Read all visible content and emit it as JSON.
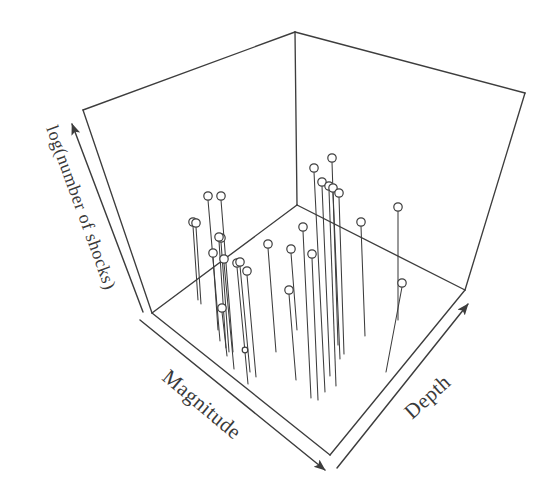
{
  "figure": {
    "title": "",
    "background_color": "#ffffff",
    "ink_color": "#3d3d3d",
    "width": 552,
    "height": 493
  },
  "axes": {
    "x": {
      "name": "magnitude-axis",
      "label": "Magnitude",
      "arrow_direction": "down-right",
      "label_rotation_deg": 40
    },
    "y": {
      "name": "depth-axis",
      "label": "Depth",
      "arrow_direction": "up-right",
      "label_rotation_deg": 40
    },
    "z": {
      "name": "log-shocks-axis",
      "label": "log(number of shocks)",
      "arrow_direction": "up-left",
      "label_rotation_deg": 72
    }
  },
  "chart_data": {
    "type": "scatter",
    "subtype": "3d-stem",
    "title": "",
    "xlabel": "Magnitude",
    "ylabel": "Depth",
    "zlabel": "log(number of shocks)",
    "grid": false,
    "legend": "none",
    "axis_ticks": "none",
    "marker": "open-circle",
    "stem_to_floor": true,
    "n_points": 27,
    "note": "Axes are unlabelled arrows; values are read as normalized positions in the projected 3D box.",
    "points": [
      {
        "id": 1,
        "head": [
          208,
          196
        ],
        "foot": [
          220,
          341
        ]
      },
      {
        "id": 2,
        "head": [
          221,
          196
        ],
        "foot": [
          233,
          352
        ]
      },
      {
        "id": 3,
        "head": [
          193,
          222
        ],
        "foot": [
          198,
          300
        ]
      },
      {
        "id": 4,
        "head": [
          221,
          238
        ],
        "foot": [
          229,
          352
        ]
      },
      {
        "id": 5,
        "head": [
          213,
          253
        ],
        "foot": [
          218,
          330
        ]
      },
      {
        "id": 6,
        "head": [
          224,
          259
        ],
        "foot": [
          234,
          369
        ]
      },
      {
        "id": 7,
        "head": [
          237,
          263
        ],
        "foot": [
          248,
          384
        ]
      },
      {
        "id": 8,
        "head": [
          247,
          271
        ],
        "foot": [
          256,
          377
        ]
      },
      {
        "id": 9,
        "head": [
          222,
          308
        ],
        "foot": [
          227,
          356
        ]
      },
      {
        "id": 10,
        "head": [
          245,
          350
        ],
        "foot": [
          245,
          352
        ]
      },
      {
        "id": 11,
        "head": [
          268,
          244
        ],
        "foot": [
          276,
          352
        ]
      },
      {
        "id": 12,
        "head": [
          291,
          249
        ],
        "foot": [
          297,
          330
        ]
      },
      {
        "id": 13,
        "head": [
          289,
          290
        ],
        "foot": [
          296,
          380
        ]
      },
      {
        "id": 14,
        "head": [
          312,
          254
        ],
        "foot": [
          318,
          400
        ]
      },
      {
        "id": 15,
        "head": [
          303,
          227
        ],
        "foot": [
          311,
          398
        ]
      },
      {
        "id": 16,
        "head": [
          314,
          168
        ],
        "foot": [
          325,
          392
        ]
      },
      {
        "id": 17,
        "head": [
          332,
          158
        ],
        "foot": [
          338,
          345
        ]
      },
      {
        "id": 18,
        "head": [
          322,
          182
        ],
        "foot": [
          330,
          376
        ]
      },
      {
        "id": 19,
        "head": [
          329,
          186
        ],
        "foot": [
          336,
          386
        ]
      },
      {
        "id": 20,
        "head": [
          333,
          188
        ],
        "foot": [
          340,
          359
        ]
      },
      {
        "id": 21,
        "head": [
          361,
          222
        ],
        "foot": [
          365,
          336
        ]
      },
      {
        "id": 22,
        "head": [
          398,
          207
        ],
        "foot": [
          398,
          320
        ]
      },
      {
        "id": 23,
        "head": [
          402,
          283
        ],
        "foot": [
          386,
          372
        ]
      },
      {
        "id": 24,
        "head": [
          339,
          193
        ],
        "foot": [
          344,
          354
        ]
      },
      {
        "id": 25,
        "head": [
          240,
          262
        ],
        "foot": [
          250,
          372
        ]
      },
      {
        "id": 26,
        "head": [
          196,
          223
        ],
        "foot": [
          201,
          304
        ]
      },
      {
        "id": 27,
        "head": [
          219,
          237
        ],
        "foot": [
          226,
          348
        ]
      }
    ]
  },
  "geometry": {
    "box": {
      "top_apex": [
        295,
        32
      ],
      "back_left_top": [
        83,
        110
      ],
      "back_right_top": [
        525,
        93
      ],
      "floor_back": [
        297,
        205
      ],
      "floor_left": [
        152,
        313
      ],
      "floor_right": [
        465,
        290
      ],
      "floor_front": [
        330,
        455
      ]
    }
  }
}
